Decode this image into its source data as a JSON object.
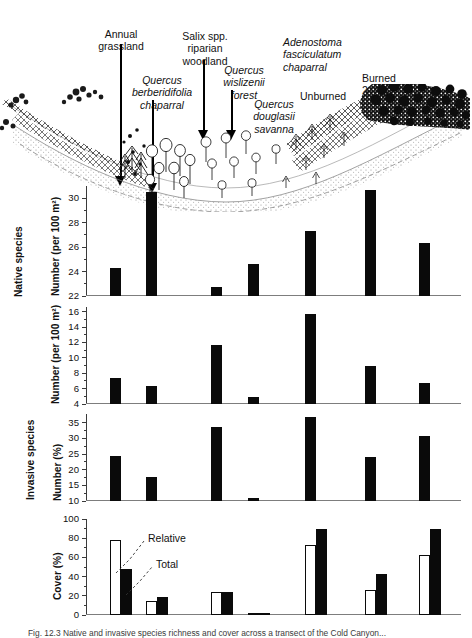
{
  "figure": {
    "caption": "Fig. 12.3  Native and invasive species richness and cover across a transect of the Cold Canyon...",
    "habitat_labels": [
      {
        "id": "annual-grassland",
        "text": "Annual\ngrassland",
        "italic_first": 0
      },
      {
        "id": "quercus-berberidifolia",
        "text": "Quercus\nberberidifolia\nchaparral",
        "italic_first": 2
      },
      {
        "id": "salix-riparian",
        "text": "Salix spp.\nriparian\nwoodland",
        "italic_first": 1
      },
      {
        "id": "quercus-wislizenii",
        "text": "Quercus\nwislizenii\nforest",
        "italic_first": 2
      },
      {
        "id": "quercus-douglasii",
        "text": "Quercus\ndouglasii\nsavanna",
        "italic_first": 2
      },
      {
        "id": "adenostoma-chaparral",
        "text": "Adenostoma\nfasciculatum\nchaparral",
        "italic_first": 2
      },
      {
        "id": "unburned",
        "text": "Unburned",
        "italic_first": 0
      },
      {
        "id": "burned",
        "text": "Burned\n2 yr ago",
        "italic_first": 0
      }
    ],
    "group_titles": {
      "native": "Native species",
      "invasive": "Invasive species"
    },
    "annotations": {
      "relative": "Relative",
      "total": "Total"
    },
    "colors": {
      "bar_fill": "#0a0a0a",
      "bar_open": "#ffffff",
      "axis": "#3a3a3a",
      "baseline": "#7d7d7d"
    }
  },
  "chart_data": [
    {
      "id": "panel-native-number",
      "type": "bar",
      "title": "",
      "ylabel": "Number (per 100 m2)",
      "ylabel_display": "Number (per 100 m²)",
      "xlabel": "",
      "ylim": [
        22,
        31
      ],
      "yticks": [
        22,
        24,
        26,
        28,
        30
      ],
      "yticklabels": [
        "22",
        "24",
        "26",
        "28",
        "30"
      ],
      "minor_ticks": true,
      "grid": false,
      "categories": [
        "Annual grassland",
        "Quercus berberidifolia chaparral",
        "Salix spp. riparian woodland",
        "Quercus wislizenii forest",
        "Quercus douglasii savanna",
        "Adenostoma fasciculatum chaparral (unburned)",
        "Adenostoma fasciculatum chaparral (burned 2 yr ago)"
      ],
      "values": [
        24.3,
        30.5,
        22.7,
        24.6,
        27.3,
        30.7,
        26.3
      ]
    },
    {
      "id": "panel-invasive-number",
      "type": "bar",
      "title": "",
      "ylabel": "Number (per 100 m2)",
      "ylabel_display": "Number (per 100 m²)",
      "xlabel": "",
      "ylim": [
        4,
        16.6
      ],
      "yticks": [
        4,
        6,
        8,
        10,
        12,
        14,
        16
      ],
      "yticklabels": [
        "4",
        "6",
        "8",
        "10",
        "12",
        "14",
        "16"
      ],
      "minor_ticks": true,
      "grid": false,
      "categories": [
        "Annual grassland",
        "Quercus berberidifolia chaparral",
        "Salix spp. riparian woodland",
        "Quercus wislizenii forest",
        "Quercus douglasii savanna",
        "Adenostoma fasciculatum chaparral (unburned)",
        "Adenostoma fasciculatum chaparral (burned 2 yr ago)"
      ],
      "values": [
        7.4,
        6.3,
        11.7,
        4.9,
        15.7,
        9.0,
        6.7
      ]
    },
    {
      "id": "panel-invasive-percent",
      "type": "bar",
      "title": "",
      "ylabel": "Number (%)",
      "ylabel_display": "Number (%)",
      "xlabel": "",
      "ylim": [
        10,
        37.8
      ],
      "yticks": [
        10,
        15,
        20,
        25,
        30,
        35
      ],
      "yticklabels": [
        "10",
        "15",
        "20",
        "25",
        "30",
        "35"
      ],
      "minor_ticks": true,
      "grid": false,
      "categories": [
        "Annual grassland",
        "Quercus berberidifolia chaparral",
        "Salix spp. riparian woodland",
        "Quercus wislizenii forest",
        "Quercus douglasii savanna",
        "Adenostoma fasciculatum chaparral (unburned)",
        "Adenostoma fasciculatum chaparral (burned 2 yr ago)"
      ],
      "values": [
        24.5,
        17.8,
        33.8,
        11.0,
        36.8,
        24.0,
        30.9
      ]
    },
    {
      "id": "panel-cover-percent",
      "type": "bar",
      "title": "",
      "ylabel": "Cover (%)",
      "ylabel_display": "Cover (%)",
      "xlabel": "",
      "ylim": [
        0,
        100
      ],
      "yticks": [
        0,
        20,
        40,
        60,
        80,
        100
      ],
      "yticklabels": [
        "0",
        "20",
        "40",
        "60",
        "80",
        "100"
      ],
      "minor_ticks": true,
      "grid": false,
      "legend_position": "inside-upper-left",
      "categories": [
        "Annual grassland",
        "Quercus berberidifolia chaparral",
        "Salix spp. riparian woodland",
        "Quercus wislizenii forest",
        "Quercus douglasii savanna",
        "Adenostoma fasciculatum chaparral (unburned)",
        "Adenostoma fasciculatum chaparral (burned 2 yr ago)"
      ],
      "series": [
        {
          "name": "Relative",
          "style": "open",
          "values": [
            78.5,
            15.0,
            24.2,
            1.8,
            72.5,
            26.5,
            62.5
          ]
        },
        {
          "name": "Total",
          "style": "filled",
          "values": [
            47.5,
            19.0,
            23.5,
            2.5,
            89.5,
            43.0,
            89.8
          ]
        }
      ]
    }
  ]
}
